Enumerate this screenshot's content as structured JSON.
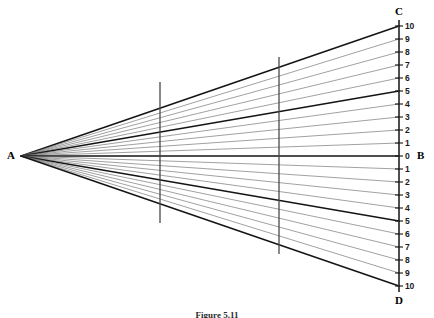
{
  "figure": {
    "caption": "Figure 5.11",
    "apex_label": "A",
    "top_label": "C",
    "bottom_label": "D",
    "axis_label": "B"
  },
  "geometry": {
    "apex_x": 21,
    "apex_y": 156,
    "scale_x": 399,
    "scale_top_y": 26,
    "scale_bottom_y": 286,
    "unit_px": 13,
    "scale_cap_top_y": 20,
    "scale_cap_bottom_y": 292,
    "section_lines": [
      {
        "x": 160,
        "y1": 82,
        "y2": 223
      },
      {
        "x": 279,
        "y1": 57,
        "y2": 254
      }
    ]
  },
  "colors": {
    "heavy_line": "#141414",
    "thin_line": "#6e6e6e",
    "scale_bar": "#3a3a3a",
    "section_line": "#4a4a4a",
    "text": "#141414",
    "background": "#ffffff"
  },
  "chart_data": {
    "type": "line",
    "title": "Figure 5.11",
    "xlabel": "",
    "ylabel": "",
    "apex": {
      "label": "A",
      "x": 21,
      "y": 156
    },
    "scale_axis": {
      "label_top": "C",
      "label_bottom": "D",
      "label_center": "B",
      "x": 399,
      "range": [
        -10,
        10
      ]
    },
    "upper_ticks": [
      {
        "value": 10,
        "label": "10",
        "y": 26,
        "weight": "heavy"
      },
      {
        "value": 9,
        "label": "9",
        "y": 39,
        "weight": "thin"
      },
      {
        "value": 8,
        "label": "8",
        "y": 52,
        "weight": "thin"
      },
      {
        "value": 7,
        "label": "7",
        "y": 65,
        "weight": "thin"
      },
      {
        "value": 6,
        "label": "6",
        "y": 78,
        "weight": "thin"
      },
      {
        "value": 5,
        "label": "5",
        "y": 91,
        "weight": "heavy"
      },
      {
        "value": 4,
        "label": "4",
        "y": 104,
        "weight": "thin"
      },
      {
        "value": 3,
        "label": "3",
        "y": 117,
        "weight": "thin"
      },
      {
        "value": 2,
        "label": "2",
        "y": 130,
        "weight": "thin"
      },
      {
        "value": 1,
        "label": "1",
        "y": 143,
        "weight": "thin"
      }
    ],
    "center_tick": {
      "value": 0,
      "label": "0",
      "y": 156,
      "weight": "heavy"
    },
    "lower_ticks": [
      {
        "value": -1,
        "label": "1",
        "y": 169,
        "weight": "thin"
      },
      {
        "value": -2,
        "label": "2",
        "y": 182,
        "weight": "thin"
      },
      {
        "value": -3,
        "label": "3",
        "y": 195,
        "weight": "thin"
      },
      {
        "value": -4,
        "label": "4",
        "y": 208,
        "weight": "thin"
      },
      {
        "value": -5,
        "label": "5",
        "y": 221,
        "weight": "heavy"
      },
      {
        "value": -6,
        "label": "6",
        "y": 234,
        "weight": "thin"
      },
      {
        "value": -7,
        "label": "7",
        "y": 247,
        "weight": "thin"
      },
      {
        "value": -8,
        "label": "8",
        "y": 260,
        "weight": "thin"
      },
      {
        "value": -9,
        "label": "9",
        "y": 273,
        "weight": "thin"
      },
      {
        "value": -10,
        "label": "10",
        "y": 286,
        "weight": "heavy"
      }
    ],
    "ray_count": 21,
    "heavy_rays": [
      10,
      5,
      0,
      -5,
      -10
    ],
    "section_lines": [
      {
        "name": "section-1",
        "x": 160
      },
      {
        "name": "section-2",
        "x": 279
      }
    ]
  }
}
